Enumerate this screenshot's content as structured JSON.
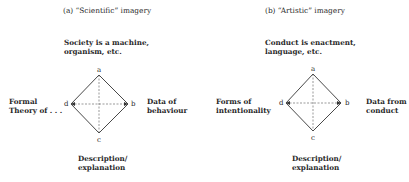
{
  "figure": {
    "panels": [
      {
        "id": "a",
        "title": "(a) “Scientific” imagery",
        "premise_line1": "Society is a machine,",
        "premise_line2": "organism, etc.",
        "left_line1": "Formal",
        "left_line2": "Theory of . . .",
        "right_line1": "Data of",
        "right_line2": "behaviour",
        "bottom_line1": "Description/",
        "bottom_line2": "explanation",
        "vertices": {
          "a": "a",
          "b": "b",
          "c": "c",
          "d": "d"
        }
      },
      {
        "id": "b",
        "title": "(b) “Artistic” imagery",
        "premise_line1": "Conduct is enactment,",
        "premise_line2": "language, etc.",
        "left_line1": "Forms of",
        "left_line2": "intentionality",
        "right_line1": "Data from",
        "right_line2": "conduct",
        "bottom_line1": "Description/",
        "bottom_line2": "explanation",
        "vertices": {
          "a": "a",
          "b": "b",
          "c": "c",
          "d": "d"
        }
      }
    ],
    "colors": {
      "line": "#333333",
      "text": "#2a2a2a",
      "background": "#ffffff"
    }
  }
}
